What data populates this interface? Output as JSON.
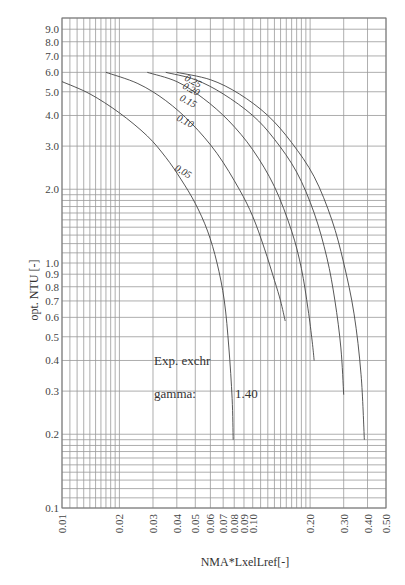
{
  "chart_data": {
    "type": "line",
    "title": "",
    "xlabel": "NMA*LxelLref[-]",
    "ylabel": "opt. NTU [-]",
    "xscale": "log",
    "yscale": "log",
    "xlim": [
      0.01,
      0.5
    ],
    "ylim": [
      0.1,
      10.0
    ],
    "grid": true,
    "x_ticks": [
      "0.01",
      "0.02",
      "0.03",
      "0.04",
      "0.05",
      "0.06",
      "0.07",
      "0.08",
      "0.09",
      "0.10",
      "0.20",
      "0.30",
      "0.40",
      "0.50"
    ],
    "y_ticks": [
      "0.1",
      "0.2",
      "0.3",
      "0.4",
      "0.5",
      "0.6",
      "0.7",
      "0.8",
      "0.9",
      "1.0",
      "2.0",
      "3.0",
      "4.0",
      "5.0",
      "6.0",
      "7.0",
      "8.0",
      "9.0"
    ],
    "annotations": [
      {
        "text": "Exp. exchr"
      },
      {
        "text": "gamma:"
      },
      {
        "text": "1.40"
      }
    ],
    "series": [
      {
        "name": "0.05",
        "points": [
          [
            0.01,
            5.5
          ],
          [
            0.014,
            4.9
          ],
          [
            0.02,
            4.1
          ],
          [
            0.028,
            3.3
          ],
          [
            0.035,
            2.7
          ],
          [
            0.042,
            2.2
          ],
          [
            0.05,
            1.75
          ],
          [
            0.058,
            1.35
          ],
          [
            0.065,
            1.0
          ],
          [
            0.071,
            0.7
          ],
          [
            0.075,
            0.45
          ],
          [
            0.078,
            0.28
          ],
          [
            0.079,
            0.19
          ]
        ]
      },
      {
        "name": "0.10",
        "points": [
          [
            0.017,
            6.0
          ],
          [
            0.025,
            5.4
          ],
          [
            0.035,
            4.6
          ],
          [
            0.048,
            3.7
          ],
          [
            0.065,
            2.8
          ],
          [
            0.085,
            2.0
          ],
          [
            0.1,
            1.55
          ],
          [
            0.115,
            1.15
          ],
          [
            0.13,
            0.85
          ],
          [
            0.14,
            0.7
          ],
          [
            0.148,
            0.58
          ]
        ]
      },
      {
        "name": "0.15",
        "points": [
          [
            0.028,
            6.0
          ],
          [
            0.04,
            5.5
          ],
          [
            0.055,
            4.7
          ],
          [
            0.075,
            3.8
          ],
          [
            0.1,
            2.9
          ],
          [
            0.13,
            2.05
          ],
          [
            0.16,
            1.35
          ],
          [
            0.18,
            0.95
          ],
          [
            0.195,
            0.65
          ],
          [
            0.205,
            0.48
          ],
          [
            0.21,
            0.4
          ]
        ]
      },
      {
        "name": "0.20",
        "points": [
          [
            0.035,
            6.0
          ],
          [
            0.05,
            5.6
          ],
          [
            0.07,
            4.9
          ],
          [
            0.1,
            4.0
          ],
          [
            0.13,
            3.2
          ],
          [
            0.17,
            2.35
          ],
          [
            0.21,
            1.6
          ],
          [
            0.245,
            1.05
          ],
          [
            0.27,
            0.7
          ],
          [
            0.29,
            0.45
          ],
          [
            0.3,
            0.29
          ]
        ]
      },
      {
        "name": "0.25",
        "points": [
          [
            0.04,
            6.0
          ],
          [
            0.06,
            5.6
          ],
          [
            0.085,
            4.9
          ],
          [
            0.12,
            4.0
          ],
          [
            0.16,
            3.1
          ],
          [
            0.21,
            2.25
          ],
          [
            0.26,
            1.5
          ],
          [
            0.3,
            1.0
          ],
          [
            0.34,
            0.62
          ],
          [
            0.37,
            0.35
          ],
          [
            0.385,
            0.19
          ]
        ]
      }
    ]
  },
  "labels": {
    "y_axis": "opt. NTU [-]",
    "x_axis": "NMA*LxelLref[-]",
    "note_line1": "Exp. exchr",
    "note_gamma_label": "gamma:",
    "note_gamma_value": "1.40"
  }
}
